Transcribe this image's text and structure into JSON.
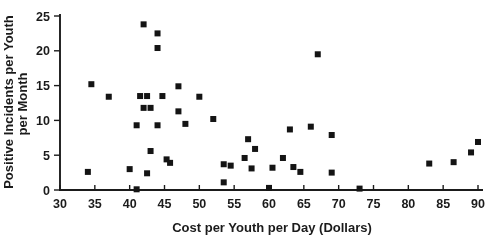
{
  "figure": {
    "background": "#ffffff",
    "ink": "#1b1b1b",
    "marker_color": "#141414",
    "marker_size_px": 6
  },
  "chart_data": {
    "type": "scatter",
    "title": "",
    "xlabel": "Cost per Youth per Day (Dollars)",
    "ylabel_line1": "Positive Incidents per Youth",
    "ylabel_line2": "per Month",
    "xlim": [
      30,
      90
    ],
    "ylim": [
      0,
      25
    ],
    "x_ticks": [
      30,
      35,
      40,
      45,
      50,
      55,
      60,
      65,
      70,
      75,
      80,
      85,
      90
    ],
    "y_ticks": [
      0,
      5,
      10,
      15,
      20,
      25
    ],
    "grid": false,
    "legend": "none",
    "marker": "filled-square",
    "points": [
      [
        34,
        2.6
      ],
      [
        34.5,
        15.2
      ],
      [
        37,
        13.4
      ],
      [
        40,
        3.0
      ],
      [
        41,
        9.3
      ],
      [
        41,
        0.1
      ],
      [
        41.5,
        13.5
      ],
      [
        42,
        23.8
      ],
      [
        42,
        11.8
      ],
      [
        42.5,
        13.5
      ],
      [
        42.5,
        2.4
      ],
      [
        43,
        11.8
      ],
      [
        43,
        5.6
      ],
      [
        44,
        22.5
      ],
      [
        44,
        20.4
      ],
      [
        44,
        9.3
      ],
      [
        44.7,
        13.5
      ],
      [
        45.3,
        4.4
      ],
      [
        45.8,
        3.9
      ],
      [
        47,
        14.9
      ],
      [
        47,
        11.3
      ],
      [
        48,
        9.5
      ],
      [
        50,
        13.4
      ],
      [
        52,
        10.2
      ],
      [
        53.5,
        3.7
      ],
      [
        53.5,
        1.1
      ],
      [
        54.5,
        3.5
      ],
      [
        56.5,
        4.6
      ],
      [
        57,
        7.3
      ],
      [
        57.5,
        3.1
      ],
      [
        58,
        5.9
      ],
      [
        60,
        0.3
      ],
      [
        60.5,
        3.2
      ],
      [
        62,
        4.6
      ],
      [
        63,
        8.7
      ],
      [
        63.5,
        3.3
      ],
      [
        64.5,
        2.6
      ],
      [
        66,
        9.1
      ],
      [
        67,
        19.5
      ],
      [
        69,
        7.9
      ],
      [
        69,
        2.5
      ],
      [
        73,
        0.2
      ],
      [
        83,
        3.8
      ],
      [
        86.5,
        4.0
      ],
      [
        89,
        5.4
      ],
      [
        90,
        6.9
      ]
    ]
  },
  "plot_geometry": {
    "x_axis_px": {
      "value_min": 30,
      "value_max": 90,
      "px_min": 60,
      "px_max": 478,
      "axis_y": 190,
      "axis_end": 483
    },
    "y_axis_px": {
      "value_min": 0,
      "value_max": 25,
      "px_min": 190,
      "px_max": 16,
      "axis_x": 60,
      "axis_top": 14
    }
  }
}
